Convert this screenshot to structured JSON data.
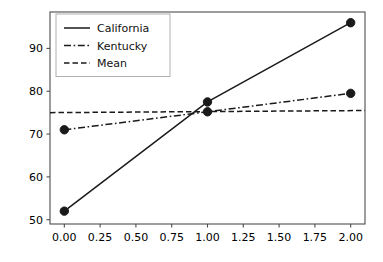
{
  "chart_data": {
    "type": "line",
    "title": "",
    "xlabel": "",
    "ylabel": "",
    "x": [
      0.0,
      1.0,
      2.0
    ],
    "xlim": [
      -0.1,
      2.1
    ],
    "ylim": [
      49.0,
      98.5
    ],
    "xticks": [
      0.0,
      0.25,
      0.5,
      0.75,
      1.0,
      1.25,
      1.5,
      1.75,
      2.0
    ],
    "xtick_labels": [
      "0.00",
      "0.25",
      "0.50",
      "0.75",
      "1.00",
      "1.25",
      "1.50",
      "1.75",
      "2.00"
    ],
    "yticks": [
      50,
      60,
      70,
      80,
      90
    ],
    "ytick_labels": [
      "50",
      "60",
      "70",
      "80",
      "90"
    ],
    "grid": false,
    "legend_position": "upper left",
    "series": [
      {
        "name": "California",
        "values": [
          52.0,
          77.5,
          96.0
        ],
        "linestyle": "solid",
        "marker": "circle",
        "color": "#1a1a1a",
        "linewidth": 1.5
      },
      {
        "name": "Kentucky",
        "values": [
          71.0,
          75.2,
          79.5
        ],
        "linestyle": "dashdot",
        "marker": "circle",
        "color": "#1a1a1a",
        "linewidth": 1.5
      },
      {
        "name": "Mean",
        "values": [
          75.0,
          75.2,
          75.5
        ],
        "linestyle": "dashed",
        "marker": "none",
        "color": "#1a1a1a",
        "linewidth": 1.5
      }
    ]
  },
  "legend": {
    "entries": [
      {
        "label": "California",
        "style": "solid"
      },
      {
        "label": "Kentucky",
        "style": "dashdot"
      },
      {
        "label": "Mean",
        "style": "dashed"
      }
    ]
  },
  "figure": {
    "background": "#ffffff",
    "axes_color": "#4d4d4d",
    "ink_color": "#1a1a1a"
  }
}
